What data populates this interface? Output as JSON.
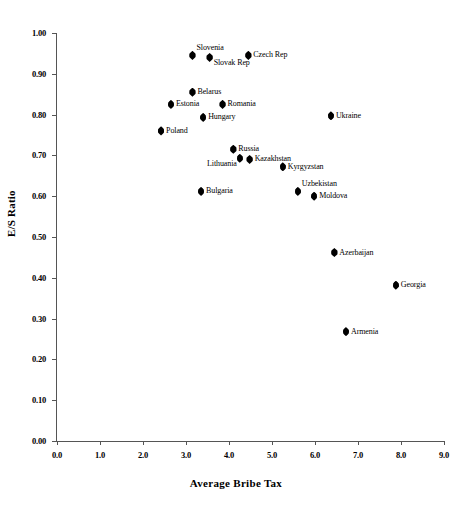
{
  "chart_data": {
    "type": "scatter",
    "title": "",
    "xlabel": "Average Bribe Tax",
    "ylabel": "E/S Ratio",
    "xlim": [
      0.0,
      9.0
    ],
    "ylim": [
      0.0,
      1.0
    ],
    "grid": false,
    "legend": null,
    "xticks": [
      "0.0",
      "1.0",
      "2.0",
      "3.0",
      "4.0",
      "5.0",
      "6.0",
      "7.0",
      "8.0",
      "9.0"
    ],
    "xtick_values": [
      0.0,
      1.0,
      2.0,
      3.0,
      4.0,
      5.0,
      6.0,
      7.0,
      8.0,
      9.0
    ],
    "yticks": [
      "0.00",
      "0.10",
      "0.20",
      "0.30",
      "0.40",
      "0.50",
      "0.60",
      "0.70",
      "0.80",
      "0.90",
      "1.00"
    ],
    "ytick_values": [
      0.0,
      0.1,
      0.2,
      0.3,
      0.4,
      0.5,
      0.6,
      0.7,
      0.8,
      0.9,
      1.0
    ],
    "marker_color": "#000000",
    "marker_shape": "diamond",
    "points": [
      {
        "label": "Slovenia",
        "x": 3.15,
        "y": 0.945,
        "label_pos": "above"
      },
      {
        "label": "Slovak Rep",
        "x": 3.55,
        "y": 0.94,
        "label_pos": "below"
      },
      {
        "label": "Czech Rep",
        "x": 4.45,
        "y": 0.945,
        "label_pos": "right"
      },
      {
        "label": "Belarus",
        "x": 3.15,
        "y": 0.855,
        "label_pos": "right"
      },
      {
        "label": "Estonia",
        "x": 2.65,
        "y": 0.825,
        "label_pos": "right"
      },
      {
        "label": "Romania",
        "x": 3.85,
        "y": 0.825,
        "label_pos": "right"
      },
      {
        "label": "Hungary",
        "x": 3.4,
        "y": 0.793,
        "label_pos": "right"
      },
      {
        "label": "Ukraine",
        "x": 6.37,
        "y": 0.797,
        "label_pos": "right"
      },
      {
        "label": "Poland",
        "x": 2.42,
        "y": 0.76,
        "label_pos": "right"
      },
      {
        "label": "Russia",
        "x": 4.1,
        "y": 0.715,
        "label_pos": "right"
      },
      {
        "label": "Lithuania",
        "x": 4.25,
        "y": 0.693,
        "label_pos": "below-left"
      },
      {
        "label": "Kazakhstan",
        "x": 4.48,
        "y": 0.69,
        "label_pos": "right"
      },
      {
        "label": "Kyrgyzstan",
        "x": 5.25,
        "y": 0.672,
        "label_pos": "right"
      },
      {
        "label": "Bulgaria",
        "x": 3.35,
        "y": 0.612,
        "label_pos": "right"
      },
      {
        "label": "Uzbekistan",
        "x": 5.6,
        "y": 0.612,
        "label_pos": "above"
      },
      {
        "label": "Moldova",
        "x": 5.98,
        "y": 0.6,
        "label_pos": "right"
      },
      {
        "label": "Azerbaijan",
        "x": 6.45,
        "y": 0.462,
        "label_pos": "right"
      },
      {
        "label": "Georgia",
        "x": 7.88,
        "y": 0.382,
        "label_pos": "right"
      },
      {
        "label": "Armenia",
        "x": 6.72,
        "y": 0.268,
        "label_pos": "right"
      }
    ]
  }
}
